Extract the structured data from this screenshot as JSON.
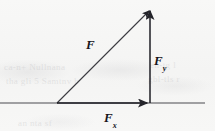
{
  "figure": {
    "kind": "force-vector-decomposition-diagram",
    "background_color": "#f6f6f5",
    "ink_color": "#2a2a2e",
    "labels": {
      "resultant": {
        "base": "F",
        "sub": ""
      },
      "vertical_component": {
        "base": "F",
        "sub": "y"
      },
      "horizontal_component": {
        "base": "F",
        "sub": "x"
      }
    },
    "geometry": {
      "origin": {
        "x": 57,
        "y": 103
      },
      "apex": {
        "x": 150,
        "y": 8
      },
      "foot": {
        "x": 150,
        "y": 103
      },
      "baseline": {
        "x1": 0,
        "y1": 103,
        "x2": 205,
        "y2": 103
      }
    },
    "ghost_text": {
      "line1": "ca-n+ Nullnana",
      "line2": "tha gli 5 Samtnv b",
      "line3": "en-tg l",
      "line4": "gbl-tls r",
      "line5": "an nta sf"
    }
  }
}
